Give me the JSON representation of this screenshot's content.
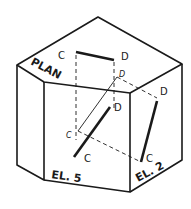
{
  "figure": {
    "labels": {
      "plan": "PLAN",
      "el5": "EL. 5",
      "el2": "EL. 2"
    },
    "points": {
      "plan_c": "C",
      "plan_d": "D",
      "proj_d": "D",
      "proj_c": "C",
      "el5_d": "D",
      "el5_c": "C",
      "el2_d": "D",
      "el2_c": "C"
    },
    "colors": {
      "ink": "#1a1a1a",
      "background": "#ffffff"
    }
  }
}
